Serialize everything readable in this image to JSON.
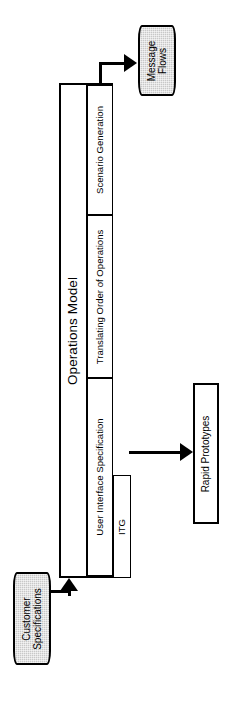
{
  "diagram": {
    "title": "Operations Model",
    "type": "block-flow-diagram",
    "orientation": "rotated-90-ccw"
  },
  "operations_model": {
    "label": "Operations Model",
    "phases": [
      {
        "id": "scenario-generation",
        "label": "Scenario Generation"
      },
      {
        "id": "translating-order-of-operations",
        "label": "Translating Order of Operations"
      },
      {
        "id": "user-interface-specification",
        "label": "User Interface Specification"
      }
    ],
    "nested": [
      {
        "id": "itg",
        "label": "ITG",
        "parent": "user-interface-specification"
      }
    ]
  },
  "outputs": [
    {
      "id": "message-flows",
      "label": "Message Flows",
      "shape": "cylinder",
      "fill": "#c8c8c8",
      "source": "scenario-generation"
    },
    {
      "id": "rapid-prototypes",
      "label": "Rapid Prototypes",
      "shape": "rectangle",
      "fill": "#ffffff",
      "source": "user-interface-specification"
    }
  ],
  "inputs": [
    {
      "id": "customer-specifications",
      "label": "Customer Specifications",
      "shape": "cylinder",
      "fill": "#c8c8c8",
      "target": "operations-model"
    }
  ],
  "labels": {
    "operations_model": "Operations Model",
    "scenario_generation": "Scenario Generation",
    "translating_order": "Translating Order of Operations",
    "user_interface_spec": "User Interface Specification",
    "itg": "ITG",
    "message_flows": "Message\nFlows",
    "message_flows_line1": "Message",
    "message_flows_line2": "Flows",
    "rapid_prototypes": "Rapid Prototypes",
    "customer_specifications_line1": "Customer",
    "customer_specifications_line2": "Specifications"
  },
  "colors": {
    "stroke": "#000000",
    "cylinder_fill": "#c8c8c8",
    "box_fill": "#ffffff",
    "page_background": "#ffffff"
  }
}
